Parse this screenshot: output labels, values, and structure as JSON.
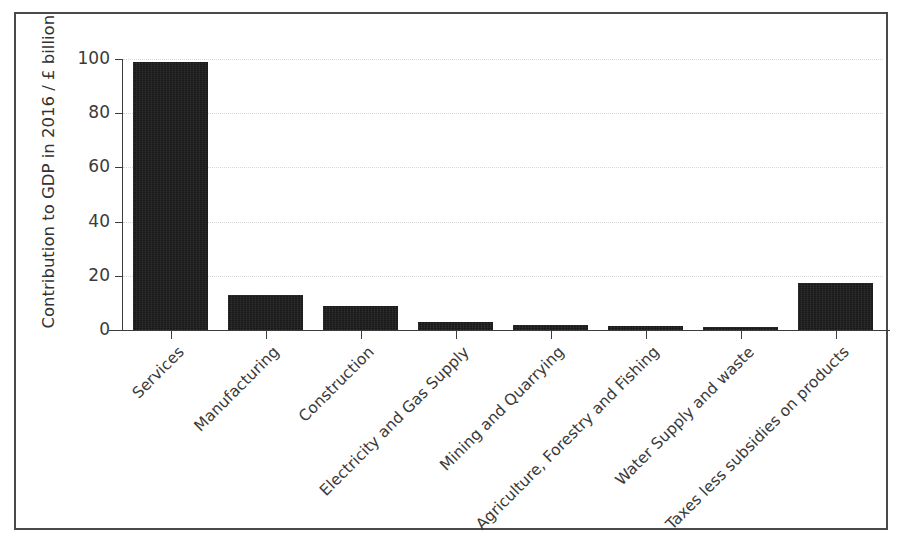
{
  "figure": {
    "frame_border_color": "#4a4a4a",
    "background_color": "#ffffff",
    "bar_color": "#191919",
    "axis_color": "#3c3c3c",
    "grid_color": "#d8d8d8"
  },
  "chart_data": {
    "type": "bar",
    "title": "",
    "xlabel": "",
    "ylabel": "Contribution to GDP in 2016 / £ billion",
    "ylim": [
      0,
      100
    ],
    "yticks": [
      0,
      20,
      40,
      60,
      80,
      100
    ],
    "ytick_labels": [
      "0",
      "20",
      "40",
      "60",
      "80",
      "100"
    ],
    "grid": true,
    "grid_axis": "y",
    "legend": false,
    "xtick_rotation": -45,
    "categories": [
      "Services",
      "Manufacturing",
      "Construction",
      "Electricity and Gas Supply",
      "Mining and Quarrying",
      "Agriculture, Forestry and Fishing",
      "Water Supply and waste",
      "Taxes less subsidies on products"
    ],
    "values": [
      98.8,
      12.8,
      8.8,
      2.8,
      1.7,
      1.3,
      1.2,
      17.5
    ]
  }
}
